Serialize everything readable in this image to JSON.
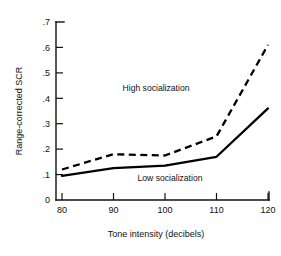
{
  "chart_data": {
    "type": "line",
    "title": "",
    "xlabel": "Tone intensity (decibels)",
    "ylabel": "Range-corrected SCR",
    "x": [
      80,
      90,
      100,
      110,
      120
    ],
    "xticklabels": [
      "80",
      "90",
      "100",
      "110",
      "120"
    ],
    "yticklabels": [
      "0",
      ".1",
      ".2",
      ".3",
      ".4",
      ".5",
      ".6",
      ".7"
    ],
    "yticks": [
      0,
      0.1,
      0.2,
      0.3,
      0.4,
      0.5,
      0.6,
      0.7
    ],
    "xlim": [
      80,
      120
    ],
    "ylim": [
      0,
      0.7
    ],
    "grid": false,
    "legend_position": "inline-annotation",
    "series": [
      {
        "name": "High socialization",
        "style": "dashed",
        "values": [
          0.12,
          0.18,
          0.175,
          0.25,
          0.61
        ]
      },
      {
        "name": "Low socialization",
        "style": "solid",
        "values": [
          0.095,
          0.125,
          0.135,
          0.17,
          0.36
        ]
      }
    ],
    "annotations": [
      {
        "text": "High socialization",
        "x": 105,
        "y": 0.425
      },
      {
        "text": "Low socialization",
        "x": 103,
        "y": 0.09
      }
    ]
  },
  "axes": {
    "y_label": "Range-corrected SCR",
    "x_label": "Tone intensity (decibels)",
    "y_ticks": [
      {
        "label": ".7",
        "value": 0.7
      },
      {
        "label": ".6",
        "value": 0.6
      },
      {
        "label": ".5",
        "value": 0.5
      },
      {
        "label": ".4",
        "value": 0.4
      },
      {
        "label": ".3",
        "value": 0.3
      },
      {
        "label": ".2",
        "value": 0.2
      },
      {
        "label": ".1",
        "value": 0.1
      },
      {
        "label": "0",
        "value": 0
      }
    ],
    "x_ticks": [
      {
        "label": "80",
        "value": 80
      },
      {
        "label": "90",
        "value": 90
      },
      {
        "label": "100",
        "value": 100
      },
      {
        "label": "110",
        "value": 110
      },
      {
        "label": "120",
        "value": 120
      }
    ]
  },
  "colors": {
    "ink": "#111111",
    "line": "#000000",
    "background": "#ffffff"
  }
}
